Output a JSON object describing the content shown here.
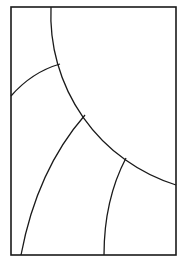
{
  "diagram": {
    "title": "",
    "background": "#ffffff",
    "stroke_color": "#1a1a1a",
    "frame": {
      "x": 11,
      "y": 7,
      "width": 165,
      "height": 248
    },
    "curves": [
      {
        "name": "main-arc",
        "d": "M 51 7 A 178 178 0 0 0 176 185"
      },
      {
        "name": "upper-left-arc",
        "d": "M 11 96 Q 32 72 60 64"
      },
      {
        "name": "middle-arc",
        "d": "M 85 115 Q 37 170 21 255"
      },
      {
        "name": "lower-right-arc",
        "d": "M 126 158 Q 104 200 104 255"
      }
    ]
  }
}
